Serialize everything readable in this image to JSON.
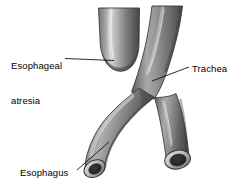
{
  "figure": {
    "background_color": "#ffffff",
    "width": 246,
    "height": 194
  },
  "labels": {
    "atresia": {
      "line1": "Esophageal",
      "line2": "atresia"
    },
    "trachea": "Trachea",
    "esophagus": "Esophagus"
  },
  "colors": {
    "tube_mid": "#8a8a8a",
    "tube_light": "#c9c9c9",
    "tube_dark": "#4f4f4f",
    "tube_edge": "#3a3a3a",
    "lumen": "#2a2a2a",
    "rim_light": "#d8d8d8",
    "leader_line": "#1a1a1a",
    "text": "#000000"
  },
  "structures": [
    {
      "name": "upper-esophageal-pouch",
      "description": "blind-ending upper esophageal pouch"
    },
    {
      "name": "trachea-trunk",
      "description": "trachea descending from top right"
    },
    {
      "name": "distal-esophagus",
      "description": "lower esophageal segment branching left"
    },
    {
      "name": "lower-trachea",
      "description": "trachea continuing inferiorly"
    }
  ],
  "leader_lines": [
    {
      "name": "atresia-leader",
      "x1": 65,
      "y1": 58.5,
      "x2": 114,
      "y2": 60.5
    },
    {
      "name": "trachea-leader",
      "x1": 189,
      "y1": 67,
      "x2": 152,
      "y2": 81
    },
    {
      "name": "esophagus-leader",
      "x1": 77,
      "y1": 170,
      "x2": 109,
      "y2": 142
    }
  ]
}
